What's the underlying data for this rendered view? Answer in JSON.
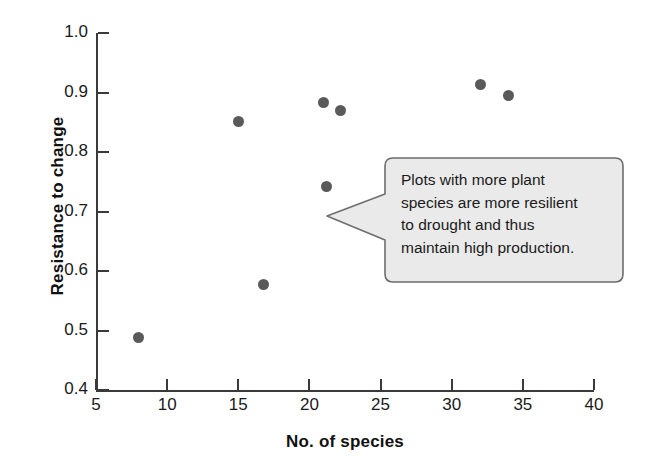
{
  "chart_data": {
    "type": "scatter",
    "title": "",
    "xlabel": "No. of species",
    "ylabel": "Resistance to change",
    "xlim": [
      5,
      40
    ],
    "ylim": [
      0.4,
      1.0
    ],
    "xticks": [
      "5",
      "10",
      "15",
      "20",
      "25",
      "30",
      "35",
      "40"
    ],
    "yticks": [
      "1.0",
      "0.9",
      "0.8",
      "0.7",
      "0.6",
      "0.5",
      "0.4"
    ],
    "grid": false,
    "legend": null,
    "point_color": "#5a5a5a",
    "axis_color": "#3a3a3a",
    "points": [
      {
        "x": 8.0,
        "y": 0.488
      },
      {
        "x": 15.0,
        "y": 0.852
      },
      {
        "x": 16.8,
        "y": 0.578
      },
      {
        "x": 21.0,
        "y": 0.883
      },
      {
        "x": 21.2,
        "y": 0.742
      },
      {
        "x": 22.2,
        "y": 0.87
      },
      {
        "x": 32.0,
        "y": 0.914
      },
      {
        "x": 34.0,
        "y": 0.895
      }
    ],
    "annotations": [
      {
        "kind": "callout",
        "lines": [
          "Plots with more plant",
          "species are more resilient",
          "to drought and thus",
          "maintain high production."
        ],
        "text": "Plots with more plant species are more resilient to drought and thus maintain high production.",
        "fill": "#eaeaea",
        "stroke": "#6e6e6e",
        "points_to": {
          "x": 22.2,
          "y": 0.702
        }
      }
    ]
  }
}
